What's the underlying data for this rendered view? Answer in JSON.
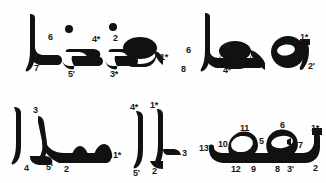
{
  "figure": {
    "background_color": "#fefefe",
    "ink_color": "#111111",
    "label_color": "#1a1a1a",
    "panel_count": 4
  },
  "panels": [
    {
      "id": "top-left",
      "name": "panel-top-left",
      "word": "منزل",
      "transliteration": "manzil",
      "labels": [
        {
          "text": "6",
          "x": 48,
          "y": 33
        },
        {
          "text": "7",
          "x": 34,
          "y": 64
        },
        {
          "text": "4*",
          "x": 92,
          "y": 35
        },
        {
          "text": "5'",
          "x": 68,
          "y": 70
        },
        {
          "text": "2",
          "x": 113,
          "y": 34
        },
        {
          "text": "3*",
          "x": 110,
          "y": 70
        },
        {
          "text": "1*",
          "x": 163,
          "y": 53
        }
      ],
      "dots": [
        {
          "x": 69,
          "y": 29,
          "r": 4
        },
        {
          "x": 113,
          "y": 27,
          "r": 4
        }
      ]
    },
    {
      "id": "top-right",
      "name": "panel-top-right",
      "word": "وها",
      "transliteration": "waha",
      "labels": [
        {
          "text": "6",
          "x": 23,
          "y": 46
        },
        {
          "text": "7",
          "x": 44,
          "y": 55
        },
        {
          "text": "8",
          "x": 18,
          "y": 65
        },
        {
          "text": "5",
          "x": 62,
          "y": 42
        },
        {
          "text": "4*",
          "x": 60,
          "y": 66
        },
        {
          "text": "3*",
          "x": 117,
          "y": 48
        },
        {
          "text": "1*",
          "x": 137,
          "y": 37
        },
        {
          "text": "2'",
          "x": 143,
          "y": 62
        }
      ],
      "dots": []
    },
    {
      "id": "bottom-left",
      "name": "panel-bottom-left",
      "word": "الاسم",
      "transliteration": "al-ism",
      "labels": [
        {
          "text": "3",
          "x": 33,
          "y": 18
        },
        {
          "text": "4",
          "x": 24,
          "y": 73
        },
        {
          "text": "5'",
          "x": 46,
          "y": 72
        },
        {
          "text": "2",
          "x": 64,
          "y": 74
        },
        {
          "text": "1*",
          "x": 108,
          "y": 61
        },
        {
          "text": "4*",
          "x": 136,
          "y": 15
        },
        {
          "text": "1*",
          "x": 154,
          "y": 13
        },
        {
          "text": "5'",
          "x": 137,
          "y": 78
        },
        {
          "text": "2",
          "x": 156,
          "y": 76
        }
      ],
      "dots": []
    },
    {
      "id": "bottom-right",
      "name": "panel-bottom-right",
      "word": "بهم",
      "transliteration": "bihim",
      "labels": [
        {
          "text": "3",
          "x": 14,
          "y": 60
        },
        {
          "text": "13'",
          "x": 41,
          "y": 54
        },
        {
          "text": "10",
          "x": 58,
          "y": 50
        },
        {
          "text": "11",
          "x": 80,
          "y": 35
        },
        {
          "text": "12",
          "x": 70,
          "y": 74
        },
        {
          "text": "9",
          "x": 88,
          "y": 74
        },
        {
          "text": "5",
          "x": 98,
          "y": 47
        },
        {
          "text": "6",
          "x": 118,
          "y": 32
        },
        {
          "text": "4*",
          "x": 113,
          "y": 48
        },
        {
          "text": "7",
          "x": 136,
          "y": 50
        },
        {
          "text": "8",
          "x": 114,
          "y": 74
        },
        {
          "text": "3'",
          "x": 126,
          "y": 74
        },
        {
          "text": "1*",
          "x": 150,
          "y": 37
        },
        {
          "text": "2",
          "x": 150,
          "y": 73
        }
      ],
      "dots": []
    }
  ]
}
